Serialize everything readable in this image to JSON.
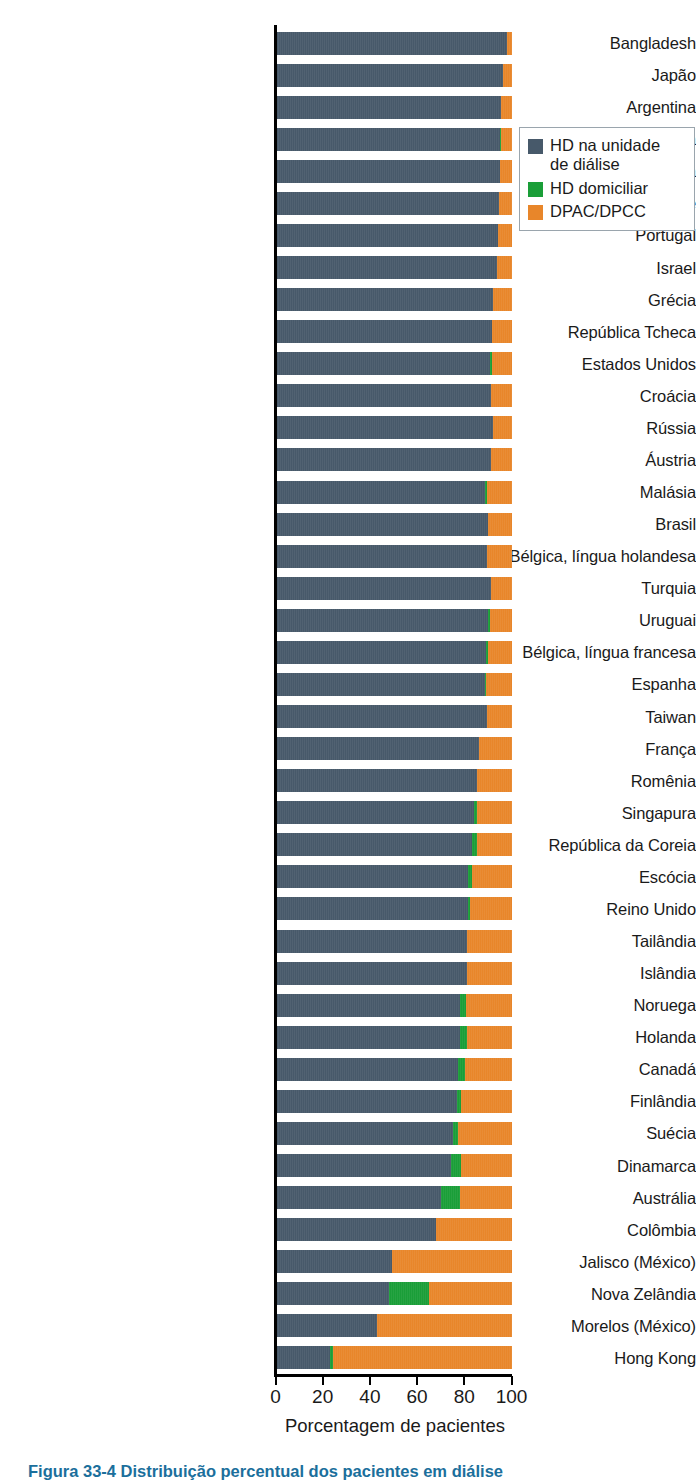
{
  "chart_data": {
    "type": "bar",
    "orientation": "horizontal",
    "stacked": true,
    "title": "",
    "xlabel": "Porcentagem de pacientes",
    "ylabel": "",
    "xlim": [
      0,
      100
    ],
    "xticks": [
      0,
      20,
      40,
      60,
      80,
      100
    ],
    "grid": false,
    "legend_position": "top-right",
    "colors": {
      "hd_unit": "#47596a",
      "hd_home": "#1a9e38",
      "pd": "#e8862a"
    },
    "series": [
      {
        "name": "HD na unidade de diálise",
        "key": "hd_unit"
      },
      {
        "name": "HD domiciliar",
        "key": "hd_home"
      },
      {
        "name": "DPAC/DPCC",
        "key": "pd"
      }
    ],
    "categories": [
      "Bangladesh",
      "Japão",
      "Argentina",
      "Alemanha",
      "Bósnia/Herzegovina",
      "Chile",
      "Portugal",
      "Israel",
      "Grécia",
      "República Tcheca",
      "Estados Unidos",
      "Croácia",
      "Rússia",
      "Áustria",
      "Malásia",
      "Brasil",
      "Bélgica, língua holandesa",
      "Turquia",
      "Uruguai",
      "Bélgica, língua francesa",
      "Espanha",
      "Taiwan",
      "França",
      "Romênia",
      "Singapura",
      "República da Coreia",
      "Escócia",
      "Reino Unido",
      "Tailândia",
      "Islândia",
      "Noruega",
      "Holanda",
      "Canadá",
      "Finlândia",
      "Suécia",
      "Dinamarca",
      "Austrália",
      "Colômbia",
      "Jalisco (México)",
      "Nova Zelândia",
      "Morelos (México)",
      "Hong Kong"
    ],
    "values": {
      "hd_unit": [
        98,
        96,
        95.5,
        95,
        95,
        94.5,
        94,
        93.5,
        92,
        91.5,
        90.5,
        91,
        92,
        91,
        88.5,
        90,
        89.5,
        91,
        90,
        89,
        88.5,
        89.5,
        86,
        85,
        84,
        83,
        81.5,
        81.5,
        81,
        81,
        78,
        78,
        77,
        76.5,
        75,
        74,
        70,
        68,
        49,
        48,
        43,
        23
      ],
      "hd_home": [
        0,
        0,
        0,
        0.5,
        0,
        0,
        0,
        0,
        0,
        0,
        1.2,
        0,
        0,
        0,
        1.0,
        0,
        0,
        0,
        0.8,
        1.0,
        0.5,
        0,
        0,
        0,
        1.3,
        2.0,
        1.5,
        0.5,
        0,
        0,
        2.5,
        2.8,
        3.0,
        2.0,
        2.2,
        4.5,
        8.0,
        0,
        0,
        17,
        0,
        1.2
      ],
      "pd": [
        2,
        4,
        4.5,
        4.5,
        5,
        5.5,
        6,
        6.5,
        8,
        8.5,
        8.3,
        9,
        8,
        9,
        10.5,
        10,
        10.5,
        9,
        9.2,
        10,
        11,
        10.5,
        14,
        15,
        14.7,
        15,
        17,
        18,
        19,
        19,
        19.5,
        19.2,
        20,
        21.5,
        22.8,
        21.5,
        22,
        32,
        51,
        35,
        57,
        75.8
      ]
    }
  },
  "legend": {
    "items": [
      {
        "label": "HD na unidade\nde diálise",
        "swatch": "sw-hd"
      },
      {
        "label": "HD domiciliar",
        "swatch": "sw-home"
      },
      {
        "label": "DPAC/DPCC",
        "swatch": "sw-pd"
      }
    ]
  },
  "caption": {
    "text": "Figura 33-4 Distribuição percentual dos pacientes em diálise"
  }
}
